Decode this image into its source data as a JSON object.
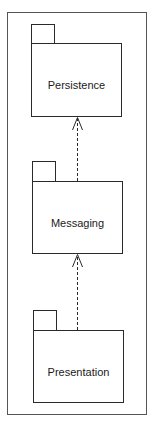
{
  "diagram": {
    "type": "uml-package-dependency",
    "colors": {
      "stroke": "#2a2a2a",
      "frame": "#555555",
      "background": "#ffffff",
      "text": "#1a1a1a"
    },
    "packages": [
      {
        "id": "persistence",
        "label": "Persistence"
      },
      {
        "id": "messaging",
        "label": "Messaging"
      },
      {
        "id": "presentation",
        "label": "Presentation"
      }
    ],
    "dependencies": [
      {
        "from": "messaging",
        "to": "persistence",
        "style": "dashed",
        "arrowhead": "open"
      },
      {
        "from": "presentation",
        "to": "messaging",
        "style": "dashed",
        "arrowhead": "open"
      }
    ]
  }
}
